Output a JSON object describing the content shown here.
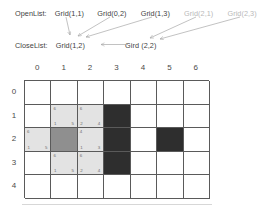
{
  "lists": {
    "openlist": {
      "label": "OpenList:",
      "items": [
        {
          "text": "Grid(1,1)",
          "faded": false
        },
        {
          "text": "Grid(0,2)",
          "faded": false
        },
        {
          "text": "Grid(1,3)",
          "faded": false
        },
        {
          "text": "Grid(2,1)",
          "faded": true
        },
        {
          "text": "Grid(2,3)",
          "faded": true
        }
      ]
    },
    "closelist": {
      "label": "CloseList:",
      "items": [
        {
          "text": "Grid(1,2)",
          "faded": false
        },
        {
          "text": "Gird (2,2)",
          "faded": false
        }
      ]
    },
    "arrow_color": "#a8a8a8"
  },
  "grid": {
    "col_headers": [
      "0",
      "1",
      "2",
      "3",
      "4",
      "5",
      "6"
    ],
    "row_headers": [
      "0",
      "1",
      "2",
      "3",
      "4"
    ],
    "colors": {
      "open": "#e3e3e3",
      "closed": "#8f8f8f",
      "wall": "#2e2e2e",
      "empty": "#ffffff",
      "line": "#5a5a5a"
    },
    "cells": [
      {
        "col": 1,
        "row": 1,
        "state": "open",
        "f": "6",
        "g": "1",
        "h": "5"
      },
      {
        "col": 2,
        "row": 1,
        "state": "open",
        "f": "6",
        "g": "2",
        "h": "4"
      },
      {
        "col": 3,
        "row": 1,
        "state": "wall",
        "f": "",
        "g": "",
        "h": ""
      },
      {
        "col": 0,
        "row": 2,
        "state": "open",
        "f": "6",
        "g": "1",
        "h": "5"
      },
      {
        "col": 1,
        "row": 2,
        "state": "closed",
        "f": "",
        "g": "",
        "h": ""
      },
      {
        "col": 2,
        "row": 2,
        "state": "open",
        "f": "4",
        "g": "1",
        "h": "3"
      },
      {
        "col": 3,
        "row": 2,
        "state": "wall",
        "f": "",
        "g": "",
        "h": ""
      },
      {
        "col": 5,
        "row": 2,
        "state": "wall",
        "f": "",
        "g": "",
        "h": ""
      },
      {
        "col": 1,
        "row": 3,
        "state": "open",
        "f": "6",
        "g": "1",
        "h": "5"
      },
      {
        "col": 2,
        "row": 3,
        "state": "open",
        "f": "6",
        "g": "2",
        "h": "4"
      },
      {
        "col": 3,
        "row": 3,
        "state": "wall",
        "f": "",
        "g": "",
        "h": ""
      }
    ]
  }
}
